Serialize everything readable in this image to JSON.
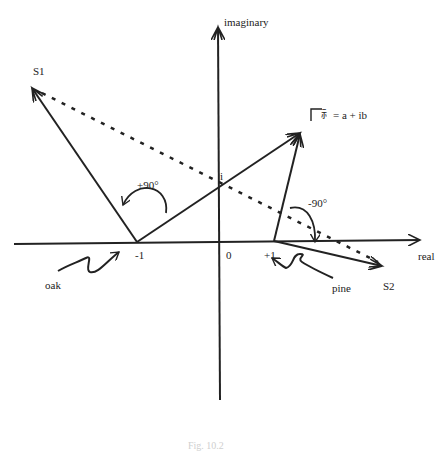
{
  "diagram": {
    "axes": {
      "x_label": "real",
      "y_label": "imaginary"
    },
    "tick_labels": {
      "origin": "0",
      "minus_one": "-1",
      "plus_one": "+1",
      "i": "i"
    },
    "points": {
      "s1": "S1",
      "s2": "S2"
    },
    "equation": "= a + ib",
    "equation_symbol": "⺬",
    "angles": {
      "positive": "+90°",
      "negative": "-90°"
    },
    "wavy_arrow_labels": {
      "left": "oak",
      "right": "pine"
    },
    "caption": "Fig. 10.2"
  },
  "colors": {
    "ink": "#222222",
    "background": "#ffffff"
  }
}
